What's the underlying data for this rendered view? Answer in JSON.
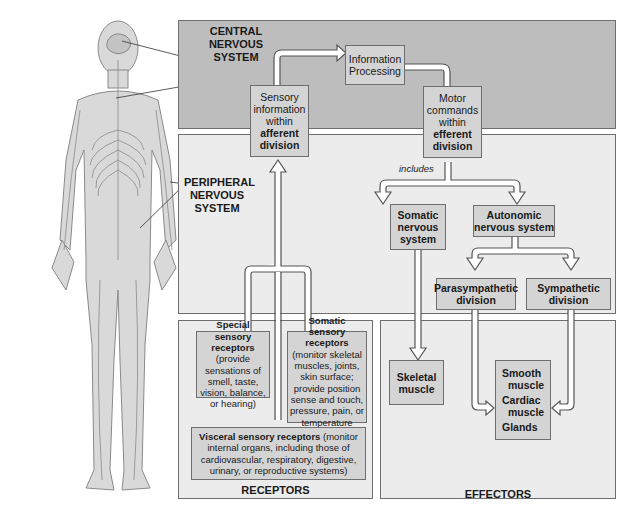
{
  "figure": {
    "body_labels": {
      "brain": "Brain",
      "spinal_cord_line1": "Spinal",
      "spinal_cord_line2": "cord",
      "pns_line1": "PERIPHERAL",
      "pns_line2": "NERVOUS",
      "pns_line3": "SYSTEM"
    },
    "cns": {
      "title_line1": "CENTRAL NERVOUS",
      "title_line2": "SYSTEM",
      "afferent_box": {
        "line1": "Sensory",
        "line2": "information",
        "line3": "within",
        "bold1": "afferent",
        "bold2": "division"
      },
      "processing_box": {
        "line1": "Information",
        "line2": "Processing"
      },
      "efferent_box": {
        "line1": "Motor",
        "line2": "commands",
        "line3": "within",
        "bold1": "efferent",
        "bold2": "division"
      }
    },
    "pns": {
      "includes": "includes",
      "somatic": {
        "line1": "Somatic",
        "line2": "nervous",
        "line3": "system"
      },
      "autonomic": {
        "line1": "Autonomic",
        "line2": "nervous system"
      },
      "parasympathetic": {
        "line1": "Parasympathetic",
        "line2": "division"
      },
      "sympathetic": {
        "line1": "Sympathetic",
        "line2": "division"
      }
    },
    "receptors": {
      "title": "RECEPTORS",
      "special": {
        "bold1": "Special sensory",
        "bold2": "receptors",
        "text": "(provide sensations of smell, taste, vision, balance, or hearing)"
      },
      "somatic": {
        "bold1": "Somatic sensory",
        "bold2": "receptors",
        "text": "(monitor skeletal muscles, joints, skin surface; provide position sense and touch, pressure, pain, or temperature sensations)"
      },
      "visceral": {
        "bold": "Visceral sensory receptors",
        "text": "(monitor internal organs, including those of cardiovascular, respiratory, digestive, urinary, or reproductive systems)"
      }
    },
    "effectors": {
      "title": "EFFECTORS",
      "skeletal": {
        "line1": "Skeletal",
        "line2": "muscle"
      },
      "targets": {
        "smooth1": "Smooth",
        "smooth2": "muscle",
        "cardiac1": "Cardiac",
        "cardiac2": "muscle",
        "glands": "Glands"
      }
    }
  },
  "colors": {
    "cns_fill": "#bdbdbd",
    "panel_fill": "#ececec",
    "box_fill": "#d4d4d4",
    "border": "#6e6e6e"
  }
}
